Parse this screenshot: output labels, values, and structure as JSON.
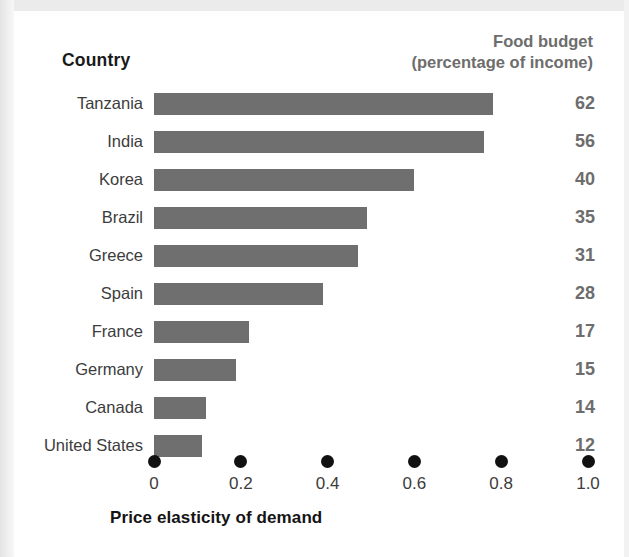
{
  "header": {
    "country_label": "Country",
    "budget_label_line1": "Food budget",
    "budget_label_line2": "(percentage of income)"
  },
  "axis": {
    "title": "Price elasticity of demand",
    "ticks": [
      "0",
      "0.2",
      "0.4",
      "0.6",
      "0.8",
      "1.0"
    ]
  },
  "colors": {
    "bar": "#6f6f6f",
    "value_text": "#6d6d6d",
    "label_text": "#3c3c3c",
    "axis_dot": "#111111",
    "background": "#ffffff"
  },
  "rows": [
    {
      "country": "Tanzania",
      "elasticity": 0.78,
      "food_budget": "62"
    },
    {
      "country": "India",
      "elasticity": 0.76,
      "food_budget": "56"
    },
    {
      "country": "Korea",
      "elasticity": 0.6,
      "food_budget": "40"
    },
    {
      "country": "Brazil",
      "elasticity": 0.49,
      "food_budget": "35"
    },
    {
      "country": "Greece",
      "elasticity": 0.47,
      "food_budget": "31"
    },
    {
      "country": "Spain",
      "elasticity": 0.39,
      "food_budget": "28"
    },
    {
      "country": "France",
      "elasticity": 0.22,
      "food_budget": "17"
    },
    {
      "country": "Germany",
      "elasticity": 0.19,
      "food_budget": "15"
    },
    {
      "country": "Canada",
      "elasticity": 0.12,
      "food_budget": "14"
    },
    {
      "country": "United States",
      "elasticity": 0.11,
      "food_budget": "12"
    }
  ],
  "chart_data": {
    "type": "bar",
    "orientation": "horizontal",
    "title": "",
    "xlabel": "Price elasticity of demand",
    "ylabel": "Country",
    "categories": [
      "Tanzania",
      "India",
      "Korea",
      "Brazil",
      "Greece",
      "Spain",
      "France",
      "Germany",
      "Canada",
      "United States"
    ],
    "values": [
      0.78,
      0.76,
      0.6,
      0.49,
      0.47,
      0.39,
      0.22,
      0.19,
      0.12,
      0.11
    ],
    "xlim": [
      0,
      1.0
    ],
    "xticks": [
      0,
      0.2,
      0.4,
      0.6,
      0.8,
      1.0
    ],
    "xtick_labels": [
      "0",
      "0.2",
      "0.4",
      "0.6",
      "0.8",
      "1.0"
    ],
    "grid": false,
    "legend": null,
    "annotations": {
      "column_header": "Food budget (percentage of income)",
      "column_values": [
        "62",
        "56",
        "40",
        "35",
        "31",
        "28",
        "17",
        "15",
        "14",
        "12"
      ]
    }
  }
}
